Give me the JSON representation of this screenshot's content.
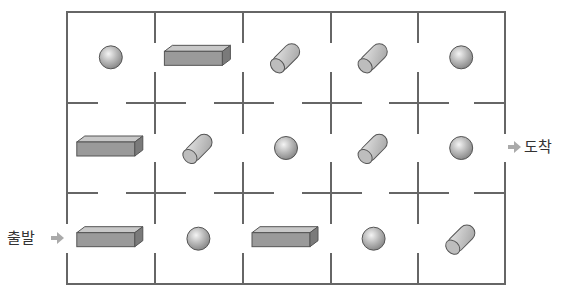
{
  "labels": {
    "start": "출발",
    "finish": "도착"
  },
  "colors": {
    "wall": "#666666",
    "arrow": "#aaaaaa",
    "object_fill": "#a8a8a8",
    "object_stroke": "#555555"
  },
  "grid": {
    "rows": 3,
    "cols": 5
  },
  "cells": [
    [
      "sphere",
      "box",
      "cylinder",
      "cylinder",
      "sphere"
    ],
    [
      "box",
      "cylinder",
      "sphere",
      "cylinder",
      "sphere"
    ],
    [
      "box",
      "sphere",
      "box",
      "sphere",
      "cylinder"
    ]
  ],
  "entrance": {
    "row": 2,
    "side": "left"
  },
  "exit": {
    "row": 1,
    "side": "right"
  }
}
